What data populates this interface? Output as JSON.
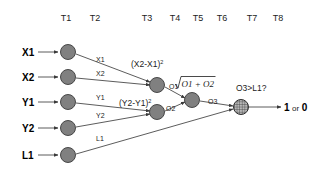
{
  "diagram": {
    "background_color": "#ffffff",
    "node_fill_color": "#808080",
    "node_stroke_color": "#3a3a3a",
    "line_color": "#4a4a4a",
    "text_color": "#1c1c1c"
  },
  "time_axis": {
    "labels": [
      {
        "text": "T1",
        "x": 66
      },
      {
        "text": "T2",
        "x": 95
      },
      {
        "text": "T3",
        "x": 147
      },
      {
        "text": "T4",
        "x": 175
      },
      {
        "text": "T5",
        "x": 198
      },
      {
        "text": "T6",
        "x": 222
      },
      {
        "text": "T7",
        "x": 252
      },
      {
        "text": "T8",
        "x": 278
      }
    ]
  },
  "inputs": [
    {
      "name": "X1",
      "label": "X1",
      "label_x": 22,
      "label_y": 56,
      "node_x": 68,
      "node_y": 52,
      "arrow_from_x": 38,
      "edge_label": "X1",
      "edge_label_x": 96,
      "edge_label_y": 62
    },
    {
      "name": "X2",
      "label": "X2",
      "label_x": 22,
      "label_y": 81,
      "node_x": 68,
      "node_y": 77,
      "arrow_from_x": 38,
      "edge_label": "X2",
      "edge_label_x": 96,
      "edge_label_y": 76
    },
    {
      "name": "Y1",
      "label": "Y1",
      "label_x": 22,
      "label_y": 106,
      "node_x": 68,
      "node_y": 102,
      "arrow_from_x": 38,
      "edge_label": "Y1",
      "edge_label_x": 96,
      "edge_label_y": 100
    },
    {
      "name": "Y2",
      "label": "Y2",
      "label_x": 22,
      "label_y": 132,
      "node_x": 68,
      "node_y": 128,
      "arrow_from_x": 38,
      "edge_label": "Y2",
      "edge_label_x": 96,
      "edge_label_y": 118
    },
    {
      "name": "L1",
      "label": "L1",
      "label_x": 22,
      "label_y": 159,
      "node_x": 68,
      "node_y": 155,
      "arrow_from_x": 38,
      "edge_label": "L1",
      "edge_label_x": 96,
      "edge_label_y": 141
    }
  ],
  "compute_nodes": [
    {
      "name": "x-difference-node",
      "x": 157,
      "y": 85,
      "r": 7.5
    },
    {
      "name": "y-difference-node",
      "x": 157,
      "y": 112,
      "r": 7.5
    },
    {
      "name": "sqrt-sum-node",
      "x": 192,
      "y": 100,
      "r": 7.5
    },
    {
      "name": "comparator-node",
      "x": 241,
      "y": 107,
      "r": 7.5
    }
  ],
  "formulas": {
    "x_diff": {
      "base": "(X2-X1)",
      "exponent": "2",
      "x": 131,
      "y": 67
    },
    "y_diff": {
      "base": "(Y2-Y1)",
      "exponent": "2",
      "x": 119,
      "y": 106
    },
    "sqrt_operand": "O1 + O2",
    "sqrt_x": 186,
    "sqrt_y": 87,
    "comparison": "O3>L1?",
    "comparison_x": 236,
    "comparison_y": 91
  },
  "intermediate_labels": [
    {
      "text": "O1",
      "x": 169,
      "y": 89
    },
    {
      "text": "O2",
      "x": 166,
      "y": 110
    },
    {
      "text": "O3",
      "x": 208,
      "y": 104
    }
  ],
  "output": {
    "value_true": "1",
    "separator": "or",
    "value_false": "0",
    "arrow_start_x": 249,
    "arrow_end_x": 281,
    "y": 107,
    "text_x": 284
  }
}
